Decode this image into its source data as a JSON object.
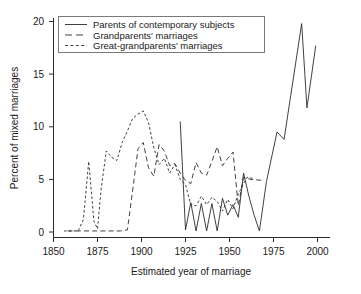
{
  "chart_data": {
    "type": "line",
    "title": "",
    "xlabel": "Estimated year of marriage",
    "ylabel": "Percent of mixed marriages",
    "xlim": [
      1850,
      2005
    ],
    "ylim": [
      0,
      20.8
    ],
    "xticks": [
      1850,
      1875,
      1900,
      1925,
      1950,
      1975,
      2000
    ],
    "yticks": [
      0,
      5,
      10,
      15,
      20
    ],
    "grid": false,
    "legend_position": "top-left",
    "series": [
      {
        "name": "Parents of contemporary subjects",
        "style": "solid",
        "points": [
          [
            1922,
            10.5
          ],
          [
            1925,
            0.2
          ],
          [
            1928,
            2.8
          ],
          [
            1931,
            0.1
          ],
          [
            1934,
            2.7
          ],
          [
            1937,
            0.1
          ],
          [
            1940,
            2.7
          ],
          [
            1943,
            0.1
          ],
          [
            1946,
            3.2
          ],
          [
            1949,
            1.6
          ],
          [
            1952,
            2.6
          ],
          [
            1955,
            1.4
          ],
          [
            1958,
            5.6
          ],
          [
            1961,
            3.4
          ],
          [
            1964,
            1.6
          ],
          [
            1967,
            0.1
          ],
          [
            1971,
            4.8
          ],
          [
            1977,
            9.5
          ],
          [
            1981,
            8.8
          ],
          [
            1991,
            19.8
          ],
          [
            1994,
            11.8
          ],
          [
            1999,
            17.7
          ]
        ]
      },
      {
        "name": "Grandparents' marriages",
        "style": "dashed",
        "points": [
          [
            1858,
            0.1
          ],
          [
            1876,
            0.1
          ],
          [
            1888,
            0.1
          ],
          [
            1892,
            0.2
          ],
          [
            1895,
            4.0
          ],
          [
            1898,
            7.9
          ],
          [
            1901,
            8.5
          ],
          [
            1904,
            6.1
          ],
          [
            1907,
            5.3
          ],
          [
            1910,
            8.3
          ],
          [
            1913,
            7.7
          ],
          [
            1916,
            6.3
          ],
          [
            1919,
            6.5
          ],
          [
            1922,
            5.6
          ],
          [
            1925,
            4.9
          ],
          [
            1928,
            4.6
          ],
          [
            1931,
            6.6
          ],
          [
            1934,
            5.6
          ],
          [
            1937,
            5.4
          ],
          [
            1940,
            6.7
          ],
          [
            1943,
            8.1
          ],
          [
            1946,
            6.3
          ],
          [
            1949,
            7.0
          ],
          [
            1952,
            7.6
          ],
          [
            1955,
            2.5
          ],
          [
            1958,
            5.2
          ],
          [
            1962,
            5.0
          ],
          [
            1969,
            4.9
          ]
        ]
      },
      {
        "name": "Great-grandparents' marriages",
        "style": "dotted",
        "points": [
          [
            1856,
            0.1
          ],
          [
            1864,
            0.1
          ],
          [
            1867,
            1.2
          ],
          [
            1870,
            6.7
          ],
          [
            1873,
            1.0
          ],
          [
            1875,
            0.3
          ],
          [
            1877,
            4.0
          ],
          [
            1880,
            7.7
          ],
          [
            1883,
            7.1
          ],
          [
            1886,
            6.8
          ],
          [
            1889,
            8.5
          ],
          [
            1892,
            9.6
          ],
          [
            1895,
            10.8
          ],
          [
            1898,
            11.2
          ],
          [
            1901,
            11.5
          ],
          [
            1904,
            10.4
          ],
          [
            1907,
            8.0
          ],
          [
            1910,
            6.4
          ],
          [
            1913,
            7.0
          ],
          [
            1916,
            5.6
          ],
          [
            1919,
            6.4
          ],
          [
            1922,
            5.0
          ],
          [
            1925,
            4.5
          ],
          [
            1928,
            2.6
          ],
          [
            1931,
            2.5
          ],
          [
            1934,
            3.4
          ],
          [
            1937,
            2.6
          ],
          [
            1940,
            3.3
          ],
          [
            1943,
            2.9
          ],
          [
            1946,
            2.0
          ],
          [
            1949,
            3.1
          ],
          [
            1952,
            2.2
          ],
          [
            1955,
            3.6
          ],
          [
            1958,
            4.6
          ],
          [
            1960,
            5.2
          ],
          [
            1963,
            5.1
          ]
        ]
      }
    ],
    "legend_entries": [
      "Parents of contemporary subjects",
      "Grandparents' marriages",
      "Great-grandparents' marriages"
    ],
    "colors": {
      "line": "#2b2b2b",
      "background": "#ffffff",
      "legend_border": "#7a7a7a"
    }
  }
}
